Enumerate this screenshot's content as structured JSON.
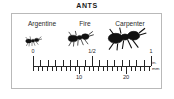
{
  "figure": {
    "title": "ANTS",
    "border_color": "#b9b9b9",
    "ink_color": "#262626"
  },
  "species": [
    {
      "label": "Argentine",
      "icon": "ant-silhouette-small",
      "body_length_mm": 2.5
    },
    {
      "label": "Fire",
      "icon": "ant-silhouette-medium",
      "body_length_mm": 4.5
    },
    {
      "label": "Carpenter",
      "icon": "ant-silhouette-large",
      "body_length_mm": 9.0
    }
  ],
  "ruler": {
    "units": {
      "inches_label": "in.",
      "millimeters_label": "mm"
    },
    "inch_labels": [
      {
        "text": "0",
        "position_pct": 0
      },
      {
        "text": "1/2",
        "position_pct": 50
      },
      {
        "text": "1",
        "position_pct": 100
      }
    ],
    "mm_labels": [
      {
        "text": "10",
        "position_pct": 39.4
      },
      {
        "text": "20",
        "position_pct": 78.7
      }
    ],
    "inch_range": [
      0,
      1
    ],
    "mm_range": [
      0,
      25.4
    ],
    "inch_minor_divisions": 16,
    "mm_minor_divisions": 25
  },
  "chart_data": {
    "type": "bar",
    "title": "ANTS",
    "categories": [
      "Argentine",
      "Fire",
      "Carpenter"
    ],
    "values": [
      2.5,
      4.5,
      9.0
    ],
    "xlabel": "",
    "ylabel": "Body length",
    "ylim": [
      0,
      25.4
    ],
    "units": "mm",
    "annotations": [
      "0",
      "1/2",
      "1",
      "10",
      "20",
      "in.",
      "mm"
    ]
  }
}
